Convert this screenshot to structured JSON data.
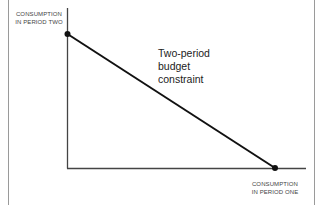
{
  "diagram": {
    "title": "Two-period budget constraint",
    "y_axis_label": {
      "line1": "CONSUMPTION",
      "line2": "IN PERIOD TWO"
    },
    "x_axis_label": {
      "line1": "CONSUMPTION",
      "line2": "IN PERIOD ONE"
    },
    "annotation": {
      "line1": "Two-period",
      "line2": "budget",
      "line3": "constraint"
    },
    "colors": {
      "axis": "#444444",
      "line": "#111111",
      "frame": "#9a9a9a"
    },
    "points": [
      {
        "name": "y-intercept",
        "x": 67,
        "y": 34
      },
      {
        "name": "x-intercept",
        "x": 275,
        "y": 168
      }
    ]
  }
}
